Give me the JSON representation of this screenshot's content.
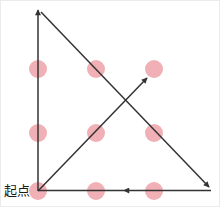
{
  "diagram": {
    "start_label": "起点",
    "canvas": {
      "width": 220,
      "height": 207
    },
    "colors": {
      "background": "#ffffff",
      "border": "#ebebeb",
      "dot": "#f0b0b5",
      "line": "#333333",
      "label": "#1a1a1a"
    },
    "dot_radius": 9,
    "line_width": 1.5,
    "dots": [
      {
        "x": 37,
        "y": 68
      },
      {
        "x": 95,
        "y": 68
      },
      {
        "x": 153,
        "y": 68
      },
      {
        "x": 37,
        "y": 132
      },
      {
        "x": 95,
        "y": 132
      },
      {
        "x": 153,
        "y": 132
      },
      {
        "x": 37,
        "y": 190
      },
      {
        "x": 95,
        "y": 190
      },
      {
        "x": 153,
        "y": 190
      }
    ],
    "segments": [
      {
        "name": "stroke-up-left-edge",
        "x1": 37,
        "y1": 190,
        "x2": 37,
        "y2": 9,
        "arrow": true
      },
      {
        "name": "stroke-diagonal-down-right",
        "x1": 40,
        "y1": 11,
        "x2": 208,
        "y2": 186,
        "arrow": true
      },
      {
        "name": "stroke-bottom-right-half",
        "x1": 210,
        "y1": 189.5,
        "x2": 123,
        "y2": 189.5,
        "arrow": true
      },
      {
        "name": "stroke-bottom-left-half",
        "x1": 123,
        "y1": 189.5,
        "x2": 37,
        "y2": 189.5,
        "arrow": false
      },
      {
        "name": "stroke-diagonal-up-right",
        "x1": 37,
        "y1": 190,
        "x2": 146,
        "y2": 77,
        "arrow": true
      }
    ],
    "label_pos": {
      "x": 3,
      "y": 194
    }
  }
}
